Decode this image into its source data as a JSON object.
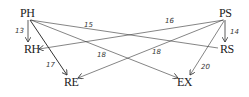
{
  "nodes": {
    "PH": {
      "label": "PH",
      "x": 20,
      "y": 7
    },
    "PS": {
      "label": "PS",
      "x": 219,
      "y": 7
    },
    "RH": {
      "label": "RH",
      "x": 25,
      "y": 43
    },
    "RS": {
      "label": "RS",
      "x": 220,
      "y": 43
    },
    "RE": {
      "label": "RE",
      "x": 65,
      "y": 76
    },
    "EX": {
      "label": "EX",
      "x": 178,
      "y": 76
    }
  },
  "edges": [
    {
      "from": "PH",
      "to": "RH",
      "label": "13"
    },
    {
      "from": "PH",
      "to": "RS",
      "label": "15"
    },
    {
      "from": "PS",
      "to": "RH",
      "label": "16"
    },
    {
      "from": "PS",
      "to": "RS",
      "label": "14"
    },
    {
      "from": "PH",
      "to": "RE",
      "label": "17"
    },
    {
      "from": "PH",
      "to": "EX",
      "label": "18"
    },
    {
      "from": "PS",
      "to": "RE",
      "label": "18"
    },
    {
      "from": "PS",
      "to": "EX",
      "label": "20"
    }
  ],
  "colors": {
    "line": "#333333",
    "text": "#222222",
    "background": "#ffffff"
  }
}
